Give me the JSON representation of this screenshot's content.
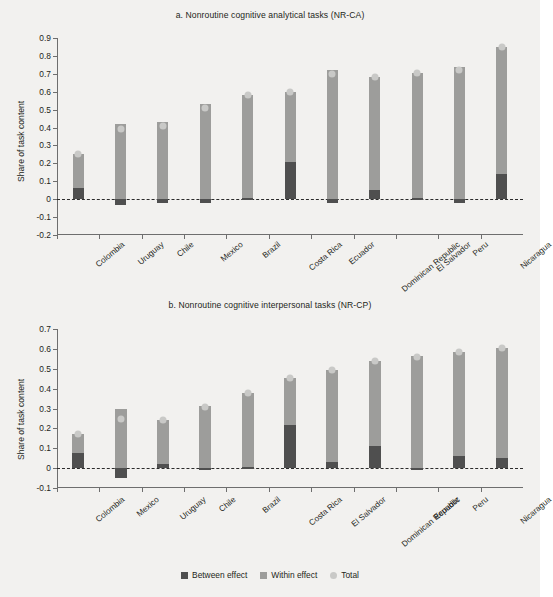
{
  "figure": {
    "ylabel": "Share of task content",
    "legend": [
      {
        "label": "Between effect",
        "color": "#4f4f4f",
        "shape": "square"
      },
      {
        "label": "Within effect",
        "color": "#9d9d9b",
        "shape": "square"
      },
      {
        "label": "Total",
        "color": "#c9c9c7",
        "shape": "circle"
      }
    ]
  },
  "chart_data": [
    {
      "type": "bar",
      "id": "panel-a",
      "title": "a. Nonroutine cognitive analytical tasks (NR-CA)",
      "xlabel": "",
      "ylabel": "Share of task content",
      "ylim": [
        -0.2,
        0.9
      ],
      "yticks": [
        -0.2,
        -0.1,
        0,
        0.1,
        0.2,
        0.3,
        0.4,
        0.5,
        0.6,
        0.7,
        0.8,
        0.9
      ],
      "ytick_labels": [
        "-0.2",
        "-0.1",
        "0",
        "0.1",
        "0.2",
        "0.3",
        "0.4",
        "0.5",
        "0.6",
        "0.7",
        "0.8",
        "0.9"
      ],
      "grid": false,
      "stacked": true,
      "categories": [
        "Colombia",
        "Uruguay",
        "Chile",
        "Mexico",
        "Brazil",
        "Costa Rica",
        "Ecuador",
        "Dominican Republic",
        "El Salvador",
        "Peru",
        "Nicaragua"
      ],
      "series": [
        {
          "name": "Between effect",
          "values": [
            0.06,
            -0.03,
            -0.02,
            -0.02,
            0.005,
            0.21,
            -0.02,
            0.05,
            0.005,
            -0.02,
            0.14
          ]
        },
        {
          "name": "Within effect",
          "values": [
            0.195,
            0.42,
            0.43,
            0.53,
            0.575,
            0.39,
            0.72,
            0.63,
            0.7,
            0.74,
            0.71
          ]
        },
        {
          "name": "Total",
          "values": [
            0.255,
            0.39,
            0.41,
            0.51,
            0.58,
            0.6,
            0.7,
            0.68,
            0.705,
            0.72,
            0.85
          ]
        }
      ]
    },
    {
      "type": "bar",
      "id": "panel-b",
      "title": "b. Nonroutine cognitive interpersonal tasks (NR-CP)",
      "xlabel": "",
      "ylabel": "Share of task content",
      "ylim": [
        -0.1,
        0.7
      ],
      "yticks": [
        -0.1,
        0,
        0.1,
        0.2,
        0.3,
        0.4,
        0.5,
        0.6,
        0.7
      ],
      "ytick_labels": [
        "-0.1",
        "0",
        "0.1",
        "0.2",
        "0.3",
        "0.4",
        "0.5",
        "0.6",
        "0.7"
      ],
      "grid": false,
      "stacked": true,
      "categories": [
        "Colombia",
        "Mexico",
        "Uruguay",
        "Chile",
        "Brazil",
        "Costa Rica",
        "El Salvador",
        "Dominican Republic",
        "Ecuador",
        "Peru",
        "Nicaragua"
      ],
      "series": [
        {
          "name": "Between effect",
          "values": [
            0.075,
            -0.05,
            0.02,
            -0.005,
            0.005,
            0.215,
            0.03,
            0.11,
            -0.005,
            0.06,
            0.05
          ]
        },
        {
          "name": "Within effect",
          "values": [
            0.095,
            0.295,
            0.22,
            0.315,
            0.375,
            0.24,
            0.465,
            0.43,
            0.565,
            0.525,
            0.555
          ]
        },
        {
          "name": "Total",
          "values": [
            0.17,
            0.245,
            0.24,
            0.31,
            0.38,
            0.455,
            0.495,
            0.54,
            0.56,
            0.585,
            0.605
          ]
        }
      ]
    }
  ]
}
